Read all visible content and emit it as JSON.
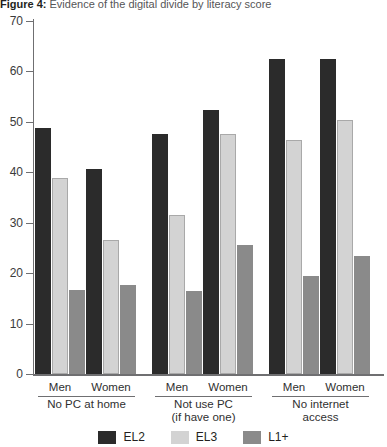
{
  "caption": {
    "label": "Figure 4:",
    "text": "Evidence of the digital divide by literacy score"
  },
  "chart_data": {
    "type": "bar",
    "title": "Evidence of the digital divide by literacy score",
    "xlabel": "",
    "ylabel": "",
    "ylim": [
      0,
      70
    ],
    "yticks": [
      0,
      10,
      20,
      30,
      40,
      50,
      60,
      70
    ],
    "ytick_labels": [
      "0",
      "10",
      "20",
      "30",
      "40",
      "50",
      "60",
      "70"
    ],
    "grid": false,
    "legend_position": "bottom",
    "categories": [
      "Men",
      "Women",
      "Men",
      "Women",
      "Men",
      "Women"
    ],
    "group_labels": [
      "No PC at home",
      "Not use PC\n(if have one)",
      "No internet\naccess"
    ],
    "groups": [
      {
        "label_line1": "No PC at home",
        "label_line2": "",
        "categories": [
          "Men",
          "Women"
        ]
      },
      {
        "label_line1": "Not use PC",
        "label_line2": "(if have one)",
        "categories": [
          "Men",
          "Women"
        ]
      },
      {
        "label_line1": "No internet",
        "label_line2": "access",
        "categories": [
          "Men",
          "Women"
        ]
      }
    ],
    "series": [
      {
        "name": "EL2",
        "color": "#2b2b2b",
        "values": [
          48.8,
          40.6,
          47.6,
          52.4,
          62.5,
          62.5
        ]
      },
      {
        "name": "EL3",
        "color": "#d3d3d3",
        "values": [
          38.8,
          26.5,
          31.6,
          47.5,
          46.5,
          50.4
        ]
      },
      {
        "name": "L1+",
        "color": "#8a8a8a",
        "values": [
          16.6,
          17.7,
          16.5,
          25.5,
          19.5,
          23.4
        ]
      }
    ]
  },
  "legend": [
    {
      "label": "EL2",
      "color": "#2b2b2b"
    },
    {
      "label": "EL3",
      "color": "#d3d3d3"
    },
    {
      "label": "L1+",
      "color": "#8a8a8a"
    }
  ]
}
